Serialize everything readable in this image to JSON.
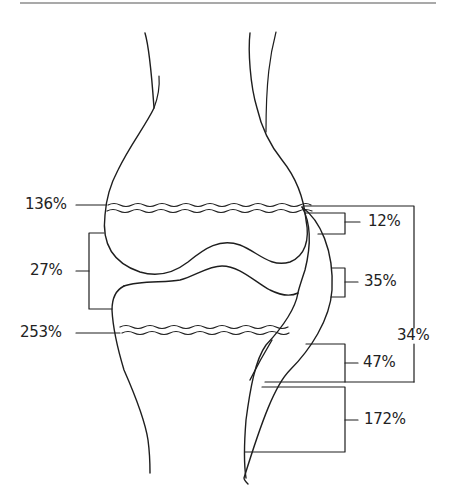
{
  "diagram": {
    "line_color": "#1e1e1e",
    "background": "#ffffff",
    "labels": {
      "growth_plate_upper": "136%",
      "joint_cartilage": "27%",
      "growth_plate_lower": "253%",
      "region_a": "12%",
      "region_b": "35%",
      "region_total": "34%",
      "region_c": "47%",
      "region_d": "172%"
    }
  }
}
